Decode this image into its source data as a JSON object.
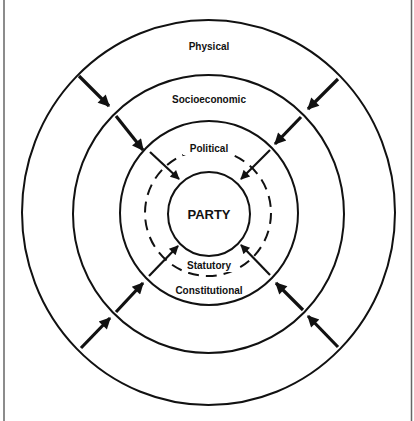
{
  "diagram": {
    "type": "concentric-rings",
    "colors": {
      "line": "#111111",
      "background": "#ffffff",
      "frame": "#666666"
    },
    "center": {
      "label": "PARTY"
    },
    "rings": [
      {
        "label": "Physical",
        "style": "solid",
        "position": "outermost"
      },
      {
        "label": "Socioeconomic",
        "style": "solid",
        "position": "second"
      },
      {
        "label": "Political",
        "style": "dashed",
        "position": "inner-top"
      },
      {
        "label": "Statutory",
        "style": "dashed",
        "position": "inner-bottom"
      },
      {
        "label": "Constitutional",
        "style": "solid",
        "position": "third"
      }
    ],
    "labels": {
      "physical": "Physical",
      "socioeconomic": "Socioeconomic",
      "political": "Political",
      "party": "PARTY",
      "statutory": "Statutory",
      "constitutional": "Constitutional"
    },
    "arrows": {
      "description": "Four diagonal chains of inward-pointing arrows, each crossing the rings toward the central PARTY circle",
      "chains": [
        "top-left",
        "top-right",
        "bottom-left",
        "bottom-right"
      ],
      "arrows_per_chain": 3
    }
  }
}
